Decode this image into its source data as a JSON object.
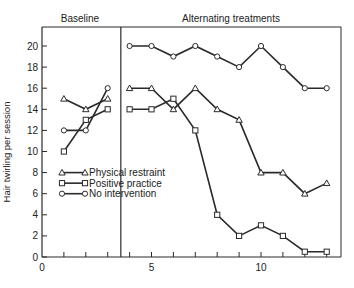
{
  "chart_data": {
    "type": "line",
    "title": "",
    "phases": [
      "Baseline",
      "Alternating treatments"
    ],
    "phase_change_after_session": 3,
    "xlabel": "",
    "ylabel": "Hair twirling per session",
    "xlim": [
      0,
      13
    ],
    "ylim": [
      0,
      20
    ],
    "x_ticks": [
      0,
      5,
      10
    ],
    "y_ticks": [
      0,
      2,
      4,
      6,
      8,
      10,
      12,
      14,
      16,
      18,
      20
    ],
    "legend_position": "lower-left",
    "series": [
      {
        "name": "No intervention",
        "marker": "circle",
        "baseline": {
          "x": [
            1,
            2,
            3
          ],
          "y": [
            12,
            12,
            16
          ]
        },
        "treatment": {
          "x": [
            4,
            5,
            6,
            7,
            8,
            9,
            10,
            11,
            12,
            13
          ],
          "y": [
            20,
            20,
            19,
            20,
            19,
            18,
            20,
            18,
            16,
            16
          ]
        }
      },
      {
        "name": "Positive practice",
        "marker": "square",
        "baseline": {
          "x": [
            1,
            2,
            3
          ],
          "y": [
            10,
            13,
            14
          ]
        },
        "treatment": {
          "x": [
            4,
            5,
            6,
            7,
            8,
            9,
            10,
            11,
            12,
            13
          ],
          "y": [
            14,
            14,
            15,
            12,
            4,
            2,
            3,
            2,
            0.5,
            0.5
          ]
        }
      },
      {
        "name": "Physical restraint",
        "marker": "triangle",
        "baseline": {
          "x": [
            1,
            2,
            3
          ],
          "y": [
            15,
            14,
            15
          ]
        },
        "treatment": {
          "x": [
            4,
            5,
            6,
            7,
            8,
            9,
            10,
            11,
            12,
            13
          ],
          "y": [
            16,
            16,
            14,
            16,
            14,
            13,
            8,
            8,
            6,
            7
          ]
        }
      }
    ]
  },
  "labels": {
    "baseline": "Baseline",
    "treatments": "Alternating treatments",
    "ylabel": "Hair twirling per session",
    "legend": [
      "No intervention",
      "Positive practice",
      "Physical restraint"
    ]
  }
}
